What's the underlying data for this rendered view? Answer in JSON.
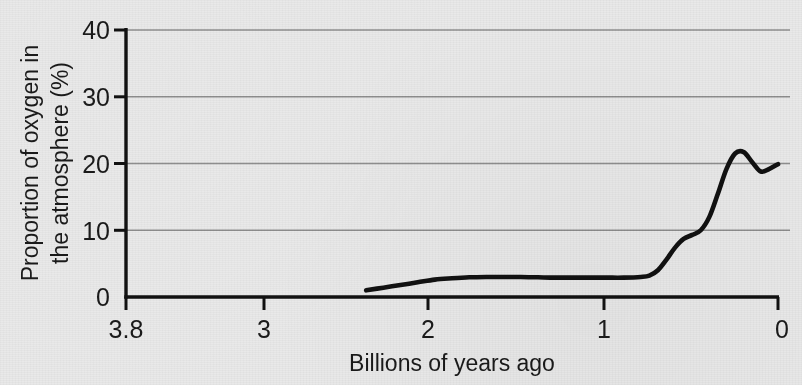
{
  "chart_data": {
    "type": "line",
    "title": "",
    "xlabel": "Billions of years ago",
    "ylabel": "Proportion of oxygen in the atmosphere (%)",
    "ylabel_line1": "Proportion of oxygen in",
    "ylabel_line2": "the atmosphere (%)",
    "xlim": [
      3.8,
      0
    ],
    "ylim": [
      0,
      40
    ],
    "x_reversed": true,
    "grid": "horizontal",
    "legend": "none",
    "xticks": [
      3.8,
      3,
      2,
      1,
      0
    ],
    "xtick_labels": [
      "3.8",
      "3",
      "2",
      "1",
      "0"
    ],
    "yticks": [
      0,
      10,
      20,
      30,
      40
    ],
    "ytick_labels": [
      "0",
      "10",
      "20",
      "30",
      "40"
    ],
    "gridlines_y": [
      10,
      20,
      30,
      40
    ],
    "series": [
      {
        "name": "Atmospheric oxygen",
        "color": "#111111",
        "x": [
          2.4,
          2.3,
          2.2,
          2.1,
          2.0,
          1.9,
          1.8,
          1.7,
          1.6,
          1.5,
          1.4,
          1.3,
          1.2,
          1.1,
          1.0,
          0.9,
          0.8,
          0.75,
          0.7,
          0.65,
          0.6,
          0.55,
          0.5,
          0.45,
          0.4,
          0.35,
          0.3,
          0.25,
          0.2,
          0.15,
          0.1,
          0.05,
          0.0
        ],
        "y": [
          1.0,
          1.4,
          1.8,
          2.2,
          2.6,
          2.8,
          2.95,
          3.0,
          3.0,
          3.0,
          2.95,
          2.9,
          2.9,
          2.9,
          2.9,
          2.9,
          3.0,
          3.2,
          4.0,
          5.6,
          7.4,
          8.7,
          9.3,
          10.0,
          12.0,
          15.5,
          19.2,
          21.5,
          21.7,
          20.2,
          18.8,
          19.2,
          19.9
        ]
      }
    ],
    "annotations": []
  },
  "figure": {
    "background_color": "#e9e9e9",
    "axis_color": "#111111",
    "grid_color": "#8e8e8e",
    "text_color": "#1a1a1a"
  }
}
